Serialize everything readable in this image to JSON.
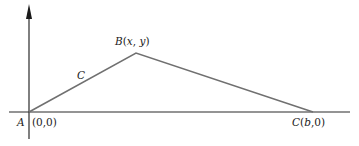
{
  "diagram": {
    "type": "triangle-path",
    "colors": {
      "axis": "#2a2a2a",
      "path": "#707070",
      "text": "#222222"
    },
    "labels": {
      "origin_name": "A",
      "origin_coords": "(0,0)",
      "peak": "B(x, y)",
      "curve": "C",
      "end": "C(b,0)"
    },
    "points": {
      "A": {
        "label": "A",
        "coords": "(0,0)"
      },
      "B": {
        "label": "B",
        "coords": "(x, y)"
      },
      "C": {
        "label": "C",
        "coords": "(b,0)"
      }
    }
  }
}
